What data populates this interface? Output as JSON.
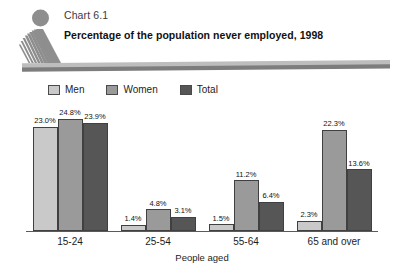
{
  "header": {
    "chart_number": "Chart 6.1",
    "title": "Percentage of the population never employed, 1998",
    "logo_icon": "statistics-canada-figure-icon"
  },
  "legend": {
    "items": [
      {
        "label": "Men",
        "color": "#c9c9c9",
        "swatch_icon": "legend-swatch-men"
      },
      {
        "label": "Women",
        "color": "#9a9a9a",
        "swatch_icon": "legend-swatch-women"
      },
      {
        "label": "Total",
        "color": "#565656",
        "swatch_icon": "legend-swatch-total"
      }
    ]
  },
  "axis": {
    "x_title": "People aged"
  },
  "chart_data": {
    "type": "bar",
    "title": "Percentage of the population never employed, 1998",
    "subtitle": "Chart 6.1",
    "xlabel": "People aged",
    "ylabel": "",
    "ylim": [
      0,
      28
    ],
    "grid": false,
    "legend_position": "top-left",
    "categories": [
      "15-24",
      "25-54",
      "55-64",
      "65 and over"
    ],
    "series": [
      {
        "name": "Men",
        "color": "#c9c9c9",
        "values": [
          23.0,
          1.4,
          1.5,
          2.3
        ],
        "labels": [
          "23.0%",
          "1.4%",
          "1.5%",
          "2.3%"
        ]
      },
      {
        "name": "Women",
        "color": "#9a9a9a",
        "values": [
          24.8,
          4.8,
          11.2,
          22.3
        ],
        "labels": [
          "24.8%",
          "4.8%",
          "11.2%",
          "22.3%"
        ]
      },
      {
        "name": "Total",
        "color": "#565656",
        "values": [
          23.9,
          3.1,
          6.4,
          13.6
        ],
        "labels": [
          "23.9%",
          "3.1%",
          "6.4%",
          "13.6%"
        ]
      }
    ]
  }
}
